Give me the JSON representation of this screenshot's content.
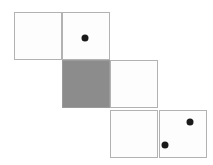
{
  "figure": {
    "canvas": {
      "width": 213,
      "height": 165,
      "background": "#ffffff"
    },
    "style": {
      "cell_size": 48,
      "border_color": "#b2b2b2",
      "cell_fill": "#fdfdfd",
      "shaded_fill": "#8c8c8c",
      "dot_color": "#1a1a1a",
      "dot_diameter": 7
    },
    "rows": [
      {
        "name": "top-row",
        "y": 12,
        "cells": [
          {
            "name": "cell-top-left",
            "x": 14,
            "shaded": false,
            "dots": []
          },
          {
            "name": "cell-top-right",
            "x": 62,
            "shaded": false,
            "dots": [
              {
                "cx": 85,
                "cy": 38
              }
            ]
          }
        ]
      },
      {
        "name": "middle-row",
        "y": 60,
        "cells": [
          {
            "name": "cell-middle-left",
            "x": 62,
            "shaded": true,
            "dots": []
          },
          {
            "name": "cell-middle-right",
            "x": 110,
            "shaded": false,
            "dots": []
          }
        ]
      },
      {
        "name": "bottom-row",
        "y": 110,
        "cells": [
          {
            "name": "cell-bottom-left",
            "x": 110,
            "shaded": false,
            "dots": [
              {
                "cx": 165,
                "cy": 145
              }
            ]
          },
          {
            "name": "cell-bottom-right",
            "x": 159,
            "shaded": false,
            "dots": [
              {
                "cx": 190,
                "cy": 122
              }
            ]
          }
        ]
      }
    ],
    "totals": {
      "cell_count": 6,
      "shaded_count": 1,
      "dot_count": 3
    }
  }
}
